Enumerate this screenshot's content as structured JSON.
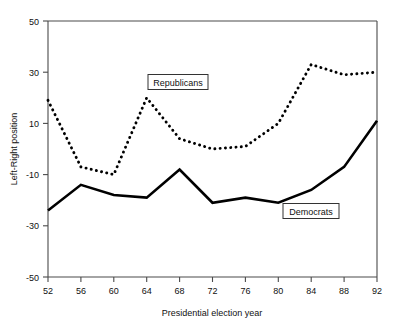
{
  "chart_data": {
    "type": "line",
    "title": "",
    "xlabel": "Presidential election year",
    "ylabel": "Left-Right position",
    "x": [
      1952,
      1956,
      1960,
      1964,
      1968,
      1972,
      1976,
      1980,
      1984,
      1988,
      1992
    ],
    "categories": [
      "52",
      "56",
      "60",
      "64",
      "68",
      "72",
      "76",
      "80",
      "84",
      "88",
      "92"
    ],
    "xlim": [
      1952,
      1992
    ],
    "ylim": [
      -50,
      50
    ],
    "yticks": [
      -50,
      -30,
      -10,
      10,
      30,
      50
    ],
    "ytick_labels": [
      "-50",
      "-30",
      "-10",
      "10",
      "30",
      "50"
    ],
    "xticks": [
      1952,
      1956,
      1960,
      1964,
      1968,
      1972,
      1976,
      1980,
      1984,
      1988,
      1992
    ],
    "xtick_labels": [
      "52",
      "56",
      "60",
      "64",
      "68",
      "72",
      "76",
      "80",
      "84",
      "88",
      "92"
    ],
    "grid": false,
    "legend_position": "inline-annotations",
    "series": [
      {
        "name": "Republicans",
        "style": "dotted",
        "color": "#000000",
        "values": [
          19,
          -7,
          -10,
          20,
          4,
          0,
          1,
          10,
          33,
          29,
          30
        ]
      },
      {
        "name": "Democrats",
        "style": "solid",
        "color": "#000000",
        "values": [
          -24,
          -14,
          -18,
          -19,
          -8,
          -21,
          -19,
          -21,
          -16,
          -7,
          11
        ]
      }
    ],
    "annotations": [
      {
        "text": "Republicans",
        "x": 1964,
        "y": 26,
        "boxed": true
      },
      {
        "text": "Democrats",
        "x": 1983,
        "y": -22,
        "boxed": true
      }
    ]
  },
  "axis": {
    "y_title": "Left-Right position",
    "x_title": "Presidential election year"
  }
}
